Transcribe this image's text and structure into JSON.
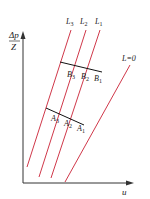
{
  "diagram": {
    "y_axis": {
      "numerator": "Δp",
      "denominator": "Z"
    },
    "x_axis": {
      "label": "u"
    },
    "lines": [
      {
        "id": "L3",
        "label": "L",
        "sub": "3"
      },
      {
        "id": "L2",
        "label": "L",
        "sub": "2"
      },
      {
        "id": "L1",
        "label": "L",
        "sub": "1"
      },
      {
        "id": "L0",
        "label": "L=0"
      }
    ],
    "b_points": [
      {
        "label": "B",
        "sub": "3"
      },
      {
        "label": "B",
        "sub": "2"
      },
      {
        "label": "B",
        "sub": "1"
      }
    ],
    "a_points": [
      {
        "label": "A",
        "sub": "3"
      },
      {
        "label": "A",
        "sub": "2"
      },
      {
        "label": "A",
        "sub": "1"
      }
    ],
    "colors": {
      "curve": "#d0384a",
      "axis": "#333333",
      "crossline": "#111111"
    }
  }
}
